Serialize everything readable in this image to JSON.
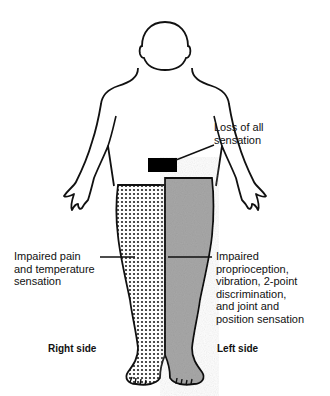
{
  "figure": {
    "colors": {
      "outline": "#111111",
      "loss_band": "#000000",
      "dotted_fill_bg": "#ffffff",
      "dotted_fill_dot": "#222222",
      "gray_fill": "#a8a8a8"
    }
  },
  "labels": {
    "loss_of_all": "Loss of all\nsensation",
    "impaired_pain": "Impaired pain\nand temperature\nsensation",
    "impaired_proprio": "Impaired\nproprioception,\nvibration, 2-point\ndiscrimination,\nand joint and\nposition sensation"
  },
  "sides": {
    "right": "Right side",
    "left": "Left side"
  },
  "legend": [
    {
      "pattern": "solid-black",
      "meaning": "Loss of all sensation",
      "region": "left hip band"
    },
    {
      "pattern": "dotted",
      "meaning": "Impaired pain and temperature sensation",
      "region": "right leg"
    },
    {
      "pattern": "gray",
      "meaning": "Impaired proprioception, vibration, 2-point discrimination, and joint and position sensation",
      "region": "left leg"
    }
  ]
}
